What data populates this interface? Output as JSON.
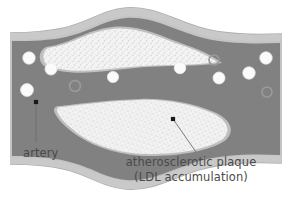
{
  "figure": {
    "background_color": "#ffffff"
  },
  "colors": {
    "outer_wall": "#c2c2c2",
    "wall_mid": "#b0b0b0",
    "lumen": "#808080",
    "lumen_dark": "#7a7a7a",
    "plaque_fill": "#f2f2f2",
    "plaque_speckle": "#d8d8d8",
    "cell_fill": "#fbfbfb",
    "cell_ring": "#9a9a9a",
    "text": "#4a4a4a",
    "leader_line": "#6d6d6d",
    "leader_dot": "#1a1a1a"
  },
  "labels": {
    "artery": "artery",
    "plaque_line1": "atherosclerotic plaque",
    "plaque_line2": "(LDL accumulation)"
  },
  "leaders": [
    {
      "name": "artery-leader",
      "dot": [
        36,
        102
      ],
      "end": [
        36,
        142
      ]
    },
    {
      "name": "plaque-leader",
      "dot": [
        173,
        119
      ],
      "end": [
        196,
        152
      ]
    }
  ],
  "structures": {
    "outer_wall_path": "M 10,35 C 10,35 40,34 62,30 C 88,25 100,12 126,9 C 152,6 170,20 196,28 C 222,36 252,36 282,35 L 282,162 C 252,162 222,162 196,170 C 170,178 152,191 126,188 C 100,185 88,172 62,167 C 40,163 10,162 10,162 Z",
    "lumen_description": "dark gray blood-filled channel pinched at center by two plaques",
    "plaque_top_description": "white speckled lens-shaped plaque bulging from upper wall",
    "plaque_bottom_description": "white speckled lens-shaped plaque bulging from lower wall"
  },
  "blood_cells": [
    {
      "name": "cell-1",
      "cx": 29,
      "cy": 58,
      "r": 6.2,
      "style": "filled"
    },
    {
      "name": "cell-2",
      "cx": 51,
      "cy": 69,
      "r": 6.0,
      "style": "filled"
    },
    {
      "name": "cell-3",
      "cx": 27,
      "cy": 90,
      "r": 6.4,
      "style": "filled"
    },
    {
      "name": "cell-4",
      "cx": 75,
      "cy": 86,
      "r": 5.4,
      "style": "ring"
    },
    {
      "name": "cell-5",
      "cx": 113,
      "cy": 77,
      "r": 5.6,
      "style": "filled"
    },
    {
      "name": "cell-6",
      "cx": 180,
      "cy": 68,
      "r": 5.8,
      "style": "filled"
    },
    {
      "name": "cell-7",
      "cx": 214,
      "cy": 60,
      "r": 5.0,
      "style": "ring"
    },
    {
      "name": "cell-8",
      "cx": 266,
      "cy": 58,
      "r": 6.2,
      "style": "filled"
    },
    {
      "name": "cell-9",
      "cx": 249,
      "cy": 73,
      "r": 6.2,
      "style": "filled"
    },
    {
      "name": "cell-10",
      "cx": 219,
      "cy": 78,
      "r": 6.0,
      "style": "filled"
    },
    {
      "name": "cell-11",
      "cx": 267,
      "cy": 92,
      "r": 5.0,
      "style": "ring"
    }
  ]
}
